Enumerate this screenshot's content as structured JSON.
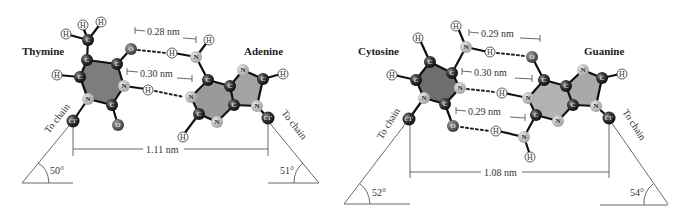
{
  "colors": {
    "carbon": "#2b2b2b",
    "nitrogen": "#b8b8b8",
    "oxygen": "#555555",
    "hydrogen": "#ffffff",
    "ring_fill_dark": "#7a7a7a",
    "ring_fill_light": "#a8a8a8",
    "line": "#444444"
  },
  "panels": [
    {
      "pair": "Thymine-Adenine",
      "left_base": {
        "name": "Thymine"
      },
      "right_base": {
        "name": "Adenine"
      },
      "hbonds": [
        {
          "label": "0.28 nm"
        },
        {
          "label": "0.30 nm"
        }
      ],
      "c1_distance": "1.11 nm",
      "left_angle": "50°",
      "right_angle": "51°",
      "left_chain": "To chain",
      "right_chain": "To chain"
    },
    {
      "pair": "Cytosine-Guanine",
      "left_base": {
        "name": "Cytosine"
      },
      "right_base": {
        "name": "Guanine"
      },
      "hbonds": [
        {
          "label": "0.29 nm"
        },
        {
          "label": "0.30 nm"
        },
        {
          "label": "0.29 nm"
        }
      ],
      "c1_distance": "1.08 nm",
      "left_angle": "52°",
      "right_angle": "54°",
      "left_chain": "To chain",
      "right_chain": "To chain"
    }
  ],
  "atom_symbols": {
    "C": "C",
    "N": "N",
    "O": "O",
    "H": "H",
    "C1": "C1'"
  }
}
